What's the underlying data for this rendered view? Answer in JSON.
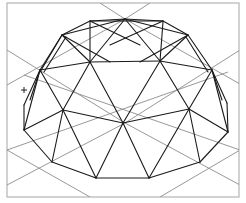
{
  "drawing": {
    "title": "Geodesic dome wireframe",
    "colors": {
      "background": "#ffffff",
      "frame": "#b5b5b5",
      "guides": "#8c8c8c",
      "edges": "#1a1a1a"
    },
    "frame": {
      "x": 7,
      "y": 3,
      "width": 232,
      "height": 194
    },
    "cursor_marker": {
      "x": 24,
      "y": 90,
      "glyph": "+"
    },
    "guide_lines": [
      [
        100,
        3,
        125,
        19
      ],
      [
        150,
        3,
        125,
        19
      ],
      [
        125,
        19,
        240,
        84
      ],
      [
        125,
        19,
        7,
        85
      ],
      [
        7,
        50,
        125,
        123
      ],
      [
        240,
        50,
        125,
        123
      ],
      [
        7,
        150,
        90,
        197
      ],
      [
        240,
        150,
        160,
        197
      ],
      [
        7,
        185,
        125,
        123
      ],
      [
        240,
        185,
        125,
        123
      ],
      [
        24,
        75,
        240,
        150
      ],
      [
        228,
        72,
        7,
        150
      ]
    ],
    "edges": [
      [
        90,
        21,
        163,
        21
      ],
      [
        90,
        21,
        62,
        35
      ],
      [
        163,
        21,
        188,
        35
      ],
      [
        90,
        21,
        125,
        19
      ],
      [
        163,
        21,
        125,
        19
      ],
      [
        62,
        35,
        40,
        70
      ],
      [
        188,
        35,
        212,
        70
      ],
      [
        40,
        70,
        24,
        105
      ],
      [
        212,
        70,
        227,
        103
      ],
      [
        24,
        105,
        24,
        130
      ],
      [
        227,
        103,
        228,
        132
      ],
      [
        90,
        22,
        90,
        62
      ],
      [
        163,
        22,
        160,
        61
      ],
      [
        90,
        62,
        160,
        61
      ],
      [
        90,
        62,
        40,
        70
      ],
      [
        160,
        61,
        212,
        70
      ],
      [
        90,
        62,
        125,
        19
      ],
      [
        160,
        61,
        125,
        19
      ],
      [
        62,
        35,
        90,
        62
      ],
      [
        188,
        35,
        160,
        61
      ],
      [
        62,
        35,
        125,
        19
      ],
      [
        188,
        35,
        125,
        19
      ],
      [
        40,
        70,
        63,
        110
      ],
      [
        212,
        70,
        189,
        109
      ],
      [
        90,
        62,
        63,
        110
      ],
      [
        160,
        61,
        189,
        109
      ],
      [
        90,
        62,
        123,
        123
      ],
      [
        160,
        61,
        123,
        123
      ],
      [
        63,
        110,
        123,
        123
      ],
      [
        189,
        109,
        123,
        123
      ],
      [
        63,
        110,
        24,
        130
      ],
      [
        189,
        109,
        228,
        132
      ],
      [
        24,
        130,
        52,
        162
      ],
      [
        228,
        132,
        200,
        162
      ],
      [
        63,
        110,
        52,
        162
      ],
      [
        189,
        109,
        200,
        162
      ],
      [
        63,
        110,
        96,
        178
      ],
      [
        189,
        109,
        149,
        178
      ],
      [
        123,
        123,
        96,
        178
      ],
      [
        123,
        123,
        149,
        178
      ],
      [
        52,
        162,
        96,
        178
      ],
      [
        96,
        178,
        149,
        178
      ],
      [
        149,
        178,
        200,
        162
      ],
      [
        40,
        70,
        24,
        130
      ],
      [
        212,
        70,
        228,
        132
      ],
      [
        62,
        35,
        40,
        72
      ],
      [
        66,
        37,
        44,
        72
      ],
      [
        186,
        37,
        208,
        72
      ],
      [
        40,
        70,
        30,
        100
      ],
      [
        212,
        70,
        222,
        100
      ],
      [
        62,
        35,
        110,
        62
      ],
      [
        188,
        35,
        140,
        62
      ],
      [
        90,
        21,
        140,
        45
      ],
      [
        163,
        21,
        110,
        45
      ]
    ]
  }
}
